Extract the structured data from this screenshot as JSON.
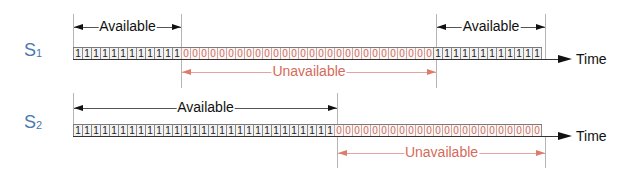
{
  "diagram": {
    "time_label": "Time",
    "colors": {
      "available": "#111111",
      "unavailable": "#d56a5a",
      "signal_label": "#4a78b0"
    },
    "signals": [
      {
        "name": "S",
        "subscript": "1",
        "bits": "1111111111110000000000000000000000000000111111111111",
        "spans": [
          {
            "label": "Available",
            "kind": "available",
            "from_cell": 0,
            "to_cell": 12,
            "position": "above"
          },
          {
            "label": "Unavailable",
            "kind": "unavailable",
            "from_cell": 12,
            "to_cell": 40,
            "position": "below"
          },
          {
            "label": "Available",
            "kind": "available",
            "from_cell": 40,
            "to_cell": 52,
            "position": "above"
          }
        ]
      },
      {
        "name": "S",
        "subscript": "2",
        "bits": "1111111111111111111111111111100000000000000000000000",
        "spans": [
          {
            "label": "Available",
            "kind": "available",
            "from_cell": 0,
            "to_cell": 29,
            "position": "above"
          },
          {
            "label": "Unavailable",
            "kind": "unavailable",
            "from_cell": 29,
            "to_cell": 52,
            "position": "below"
          }
        ]
      }
    ]
  }
}
